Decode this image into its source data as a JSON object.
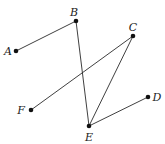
{
  "diagram": {
    "type": "graph",
    "nodes": [
      {
        "id": "A",
        "label": "A",
        "x": 16,
        "y": 51,
        "lx": 8,
        "ly": 55
      },
      {
        "id": "B",
        "label": "B",
        "x": 76,
        "y": 21,
        "lx": 74,
        "ly": 16
      },
      {
        "id": "C",
        "label": "C",
        "x": 133,
        "y": 36,
        "lx": 133,
        "ly": 31
      },
      {
        "id": "D",
        "label": "D",
        "x": 148,
        "y": 97,
        "lx": 157,
        "ly": 101
      },
      {
        "id": "E",
        "label": "E",
        "x": 89,
        "y": 126,
        "lx": 89,
        "ly": 141
      },
      {
        "id": "F",
        "label": "F",
        "x": 31,
        "y": 110,
        "lx": 21,
        "ly": 114
      }
    ],
    "edges": [
      [
        "A",
        "B"
      ],
      [
        "B",
        "E"
      ],
      [
        "C",
        "F"
      ],
      [
        "C",
        "E"
      ],
      [
        "E",
        "D"
      ]
    ],
    "colors": {
      "line": "#2a2a2a",
      "node": "#111111",
      "text": "#222222"
    }
  }
}
